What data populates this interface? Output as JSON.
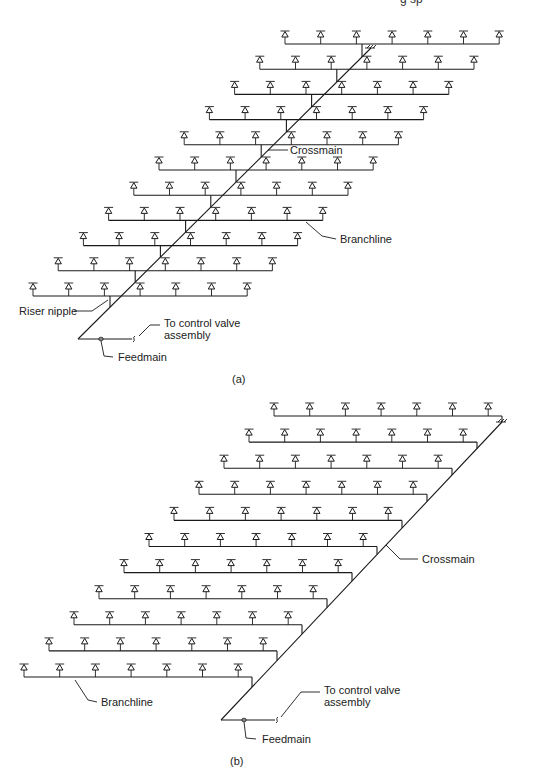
{
  "header_fragment": "g sp",
  "diagrams": [
    {
      "id": "a",
      "caption": "(a)",
      "caption_pos": [
        232,
        383
      ],
      "layout": "center-fed",
      "rows": 11,
      "sprinklers_per_row": 7,
      "sprinkler_spacing": 35.7,
      "top_row": {
        "branch_y": 44,
        "first_sprinkler_x": 285
      },
      "row_dy": 25.2,
      "row_dx": -25.2,
      "riser_offset_from_first": 77,
      "crossmain": {
        "top": [
          371,
          48
        ],
        "bottom": [
          78,
          339
        ]
      },
      "feedmain": {
        "y": 339,
        "x1": 78,
        "x2": 132,
        "fitting_x": 101,
        "break_x": 134
      },
      "labels": [
        {
          "name": "crossmain-label",
          "text": "Crossmain",
          "x": 290,
          "y": 154,
          "leader": [
            [
              268,
              150
            ],
            [
              288,
              150
            ]
          ]
        },
        {
          "name": "branchline-label",
          "text": "Branchline",
          "x": 340,
          "y": 243,
          "leader": [
            [
              306,
              222
            ],
            [
              322,
              236
            ],
            [
              336,
              239
            ]
          ]
        },
        {
          "name": "riser-nipple-label",
          "text": "Riser nipple",
          "x": 19,
          "y": 315,
          "leader": [
            [
              74,
              311
            ],
            [
              92,
              311
            ],
            [
              108,
              300
            ]
          ]
        },
        {
          "name": "to-control-valve-label",
          "text": "To control valve",
          "text2": "assembly",
          "x": 164,
          "y": 327,
          "leader": [
            [
              160,
              325
            ],
            [
              150,
              325
            ],
            [
              139,
              336
            ]
          ]
        },
        {
          "name": "feedmain-label",
          "text": "Feedmain",
          "x": 118,
          "y": 361,
          "leader": [
            [
              101,
              341
            ],
            [
              104,
              356
            ],
            [
              113,
              357
            ]
          ]
        }
      ]
    },
    {
      "id": "b",
      "caption": "(b)",
      "caption_pos": [
        230,
        765
      ],
      "layout": "end-fed",
      "rows": 11,
      "sprinklers_per_row": 7,
      "sprinkler_spacing": 35.7,
      "top_row": {
        "branch_y": 416,
        "first_sprinkler_x": 274
      },
      "row_dy": 26.1,
      "row_dx": -25.0,
      "right_end_offset_from_first": 228,
      "crossmain": {
        "top": [
          502,
          422
        ],
        "bottom": [
          221,
          720
        ]
      },
      "feedmain": {
        "y": 720,
        "x1": 221,
        "x2": 275,
        "fitting_x": 244,
        "break_x": 277
      },
      "labels": [
        {
          "name": "crossmain-label",
          "text": "Crossmain",
          "x": 422,
          "y": 563,
          "leader": [
            [
              386,
              545
            ],
            [
              400,
              559
            ],
            [
              418,
              559
            ]
          ]
        },
        {
          "name": "branchline-label",
          "text": "Branchline",
          "x": 101,
          "y": 706,
          "leader": [
            [
              75,
              680
            ],
            [
              88,
              700
            ],
            [
              97,
              702
            ]
          ]
        },
        {
          "name": "to-control-valve-label",
          "text": "To control valve",
          "text2": "assembly",
          "x": 324,
          "y": 694,
          "leader": [
            [
              320,
              692
            ],
            [
              301,
              692
            ],
            [
              281,
              717
            ]
          ]
        },
        {
          "name": "feedmain-label",
          "text": "Feedmain",
          "x": 262,
          "y": 743,
          "leader": [
            [
              244,
              722
            ],
            [
              246,
              738
            ],
            [
              256,
              739
            ]
          ]
        }
      ]
    }
  ],
  "colors": {
    "line": "#1a1a1a",
    "text": "#222222",
    "background": "#ffffff"
  }
}
